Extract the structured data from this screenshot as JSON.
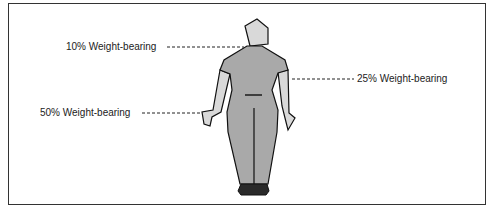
{
  "figure": {
    "labels": [
      {
        "id": "head",
        "text": "10% Weight-bearing"
      },
      {
        "id": "arm",
        "text": "25% Weight-bearing"
      },
      {
        "id": "hand",
        "text": "50% Weight-bearing"
      }
    ],
    "colors": {
      "body": "#a9a9a9",
      "limbs": "#d9d9d9",
      "feet": "#2a2a2a",
      "outline": "#111111",
      "border": "#333333"
    }
  }
}
